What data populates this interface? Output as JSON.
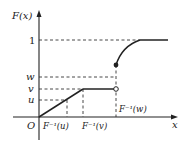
{
  "diagram": {
    "y_axis_label": "F(x)",
    "x_axis_label": "x",
    "origin_label": "O",
    "y_ticks": {
      "one": "1",
      "w": "w",
      "v": "v",
      "u": "u"
    },
    "x_ticks": {
      "finv_u": "F⁻¹(u)",
      "finv_v": "F⁻¹(v)",
      "finv_w": "F⁻¹(w)"
    },
    "colors": {
      "stroke": "#222222",
      "dash": "#333333",
      "background": "#ffffff"
    }
  }
}
